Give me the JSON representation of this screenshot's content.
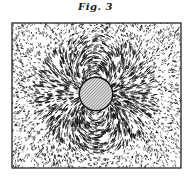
{
  "figure": {
    "title": "Fig. 3",
    "frame": {
      "x": 12,
      "y": 23,
      "width": 169,
      "height": 145,
      "stroke": "#222222"
    },
    "magnet": {
      "cx": 96,
      "cy": 94,
      "r": 16,
      "fill": "#d8d8d8",
      "hatch_color": "#555555",
      "outline": "#111111"
    },
    "ink_color": "#111111",
    "background": "#ffffff"
  }
}
